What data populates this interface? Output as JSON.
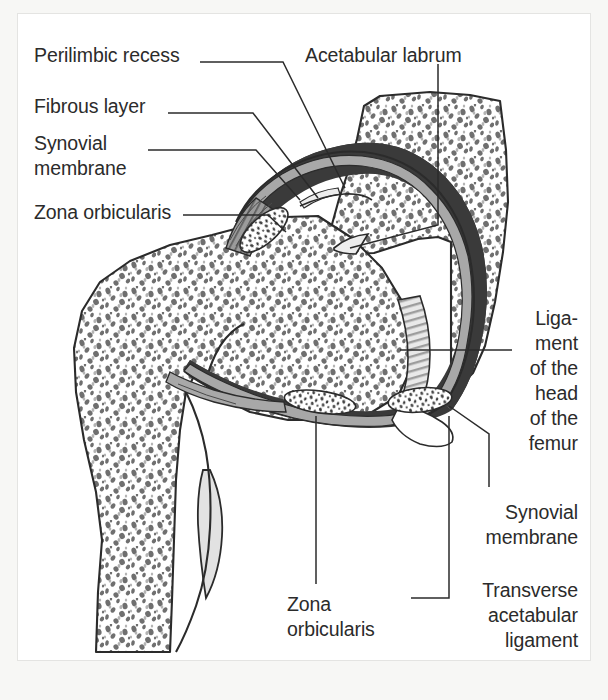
{
  "figure": {
    "kind": "anatomical-illustration",
    "background_color": "#f7f7f5",
    "plate_color": "#ffffff",
    "plate_border_color": "#e4e4e2",
    "ink_color": "#2b2b2b",
    "leader_line_color": "#2b2b2b",
    "palette": {
      "bone_fill": "#ffffff",
      "bone_outline": "#2b2b2b",
      "trabecula_speck": "#7d7d7d",
      "joint_capsule_dark": "#3a3a3a",
      "synovial_gray": "#a8a8a8",
      "fibrous_gray": "#8f8f8f",
      "cartilage_light": "#ededed",
      "lesser_trochanter_gray": "#e0e0e0",
      "ligament_stipple_fill": "#ffffff"
    }
  },
  "labels": [
    {
      "id": "perilimbic-recess",
      "text": "Perilimbic recess",
      "align": "left",
      "x": 34,
      "y": 43,
      "width": 230
    },
    {
      "id": "fibrous-layer",
      "text": "Fibrous layer",
      "align": "left",
      "x": 34,
      "y": 94,
      "width": 230
    },
    {
      "id": "synovial-membrane-left",
      "text": "Synovial\nmembrane",
      "align": "left",
      "x": 34,
      "y": 131,
      "width": 230
    },
    {
      "id": "zona-orbicularis-left",
      "text": "Zona orbicularis",
      "align": "left",
      "x": 34,
      "y": 200,
      "width": 230
    },
    {
      "id": "acetabular-labrum",
      "text": "Acetabular labrum",
      "align": "left",
      "x": 305,
      "y": 43,
      "width": 250
    },
    {
      "id": "ligament-head-femur",
      "text": "Liga-\nment\nof the\nhead\nof the\nfemur",
      "align": "right",
      "x": 448,
      "y": 306,
      "width": 130
    },
    {
      "id": "synovial-membrane-right",
      "text": "Synovial\nmembrane",
      "align": "right",
      "x": 420,
      "y": 502,
      "width": 158
    },
    {
      "id": "transverse-acetabular-ligament",
      "text": "Transverse\nacetabular\nligament",
      "align": "right",
      "x": 420,
      "y": 580,
      "width": 158
    },
    {
      "id": "zona-orbicularis-bottom",
      "text": "Zona\norbiculars",
      "align": "left",
      "x": 287,
      "y": 592,
      "width": 130
    }
  ],
  "label_text_overrides": {
    "zona-orbicularis-bottom": "Zona\norbicularis"
  },
  "leader_lines": [
    {
      "id": "leader-perilimbic-recess",
      "points": "200,62 283,62 345,188"
    },
    {
      "id": "leader-fibrous-layer",
      "points": "168,113 253,113 318,198"
    },
    {
      "id": "leader-synovial-left",
      "points": "148,150 256,150 300,200"
    },
    {
      "id": "leader-zona-orbicularis-left",
      "points": "183,215 268,215 286,232"
    },
    {
      "id": "leader-acetabular-labrum",
      "points": "438,64 438,225 350,248"
    },
    {
      "id": "leader-ligament-head-femur",
      "points": "512,350 400,350"
    },
    {
      "id": "leader-synovial-right",
      "points": "489,487 489,434 449,406"
    },
    {
      "id": "leader-transverse-acet-lig",
      "points": "411,598 449,598 449,416"
    },
    {
      "id": "leader-zona-orbicularis-bottom",
      "points": "316,584 316,416"
    }
  ],
  "anatomy_parts": [
    {
      "id": "ilium-acetabulum",
      "name": "Ilium / acetabulum (cancellous bone)"
    },
    {
      "id": "femoral-head",
      "name": "Head of femur (cancellous bone)"
    },
    {
      "id": "femoral-neck-shaft",
      "name": "Neck and shaft of femur"
    },
    {
      "id": "lesser-trochanter",
      "name": "Lesser trochanter"
    },
    {
      "id": "joint-capsule",
      "name": "Articular capsule (fibrous layer)"
    },
    {
      "id": "synovial-layer",
      "name": "Synovial membrane"
    },
    {
      "id": "acetabular-labrum-part",
      "name": "Acetabular labrum"
    },
    {
      "id": "zona-orbicularis-upper",
      "name": "Zona orbicularis (upper, cut)"
    },
    {
      "id": "zona-orbicularis-lower",
      "name": "Zona orbicularis (lower, cut)"
    },
    {
      "id": "transverse-acetabular-ligament-part",
      "name": "Transverse acetabular ligament"
    },
    {
      "id": "ligamentum-capitis-femoris",
      "name": "Ligament of the head of the femur"
    },
    {
      "id": "perilimbic-recess-part",
      "name": "Perilimbic recess"
    }
  ]
}
